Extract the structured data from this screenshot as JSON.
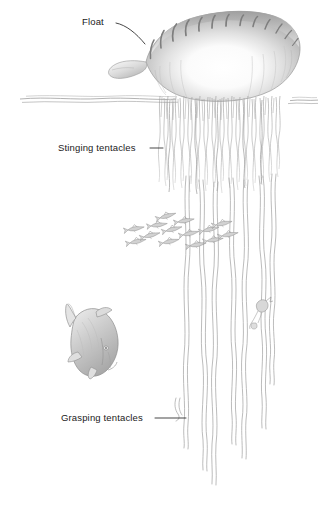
{
  "figure": {
    "medium": "pencil-drawing",
    "palette": {
      "background": "#ffffff",
      "ink": "#1a1a1a",
      "leader_line": "#2a2a2a",
      "pencil_light": "#dcdcdc",
      "pencil_mid": "#b4b4b4",
      "pencil_dark": "#8a8a8a",
      "water_line": "#9a9a9a",
      "tentacle": "#a8a8a8",
      "fish_body": "#c9c9c9",
      "fish_outline": "#8f8f8f"
    }
  },
  "labels": {
    "float": "Float",
    "stinging_tentacles": "Stinging tentacles",
    "grasping_tentacles": "Grasping tentacles"
  },
  "scene": {
    "waterline_label": "water-surface",
    "float_label": "gas-filled-float",
    "stinging_curtain_label": "stinging-tentacle-curtain",
    "grasping_strands_label": "long-grasping-tentacles",
    "large_fish_label": "large-fish",
    "fish_school_label": "school-of-small-fish",
    "prey_label": "captured-prey"
  }
}
